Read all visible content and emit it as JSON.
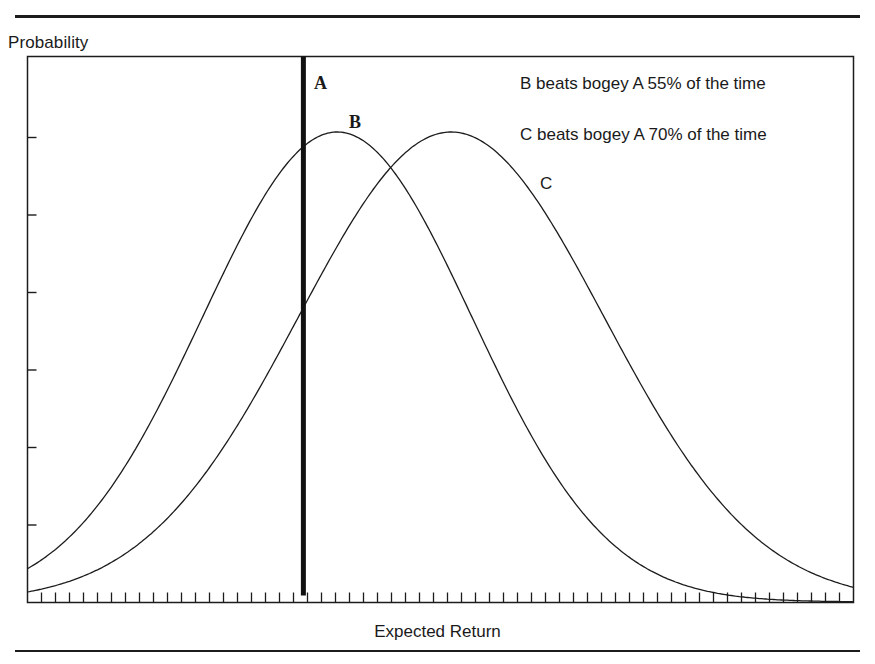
{
  "header": {
    "rule_top": true
  },
  "chart_data": {
    "type": "line",
    "title": "",
    "xlabel": "Expected Return",
    "ylabel": "Probability",
    "grid": false,
    "x_tick_count": 58,
    "y_tick_count": 6,
    "x_tick_labels": [],
    "y_tick_labels": [],
    "xlim": [
      0,
      100
    ],
    "ylim": [
      0,
      1
    ],
    "series": [
      {
        "name": "A",
        "kind": "vertical-line",
        "x": 33.4,
        "label": "A",
        "stroke_width": 5
      },
      {
        "name": "B",
        "kind": "normal-curve",
        "mean": 37.5,
        "sd": 16.3,
        "peak": 1.0,
        "label": "B"
      },
      {
        "name": "C",
        "kind": "normal-curve",
        "mean": 51.3,
        "sd": 18.5,
        "peak": 1.0,
        "label": "C"
      }
    ],
    "annotations": [
      "B beats bogey A 55% of the time",
      "C beats bogey A 70% of the time"
    ]
  },
  "labels": {
    "ylabel": "Probability",
    "xlabel": "Expected Return",
    "a": "A",
    "b": "B",
    "c": "C",
    "note_b": "B beats bogey A 55% of the time",
    "note_c": "C beats bogey A 70% of the time"
  },
  "colors": {
    "ink": "#1c1c1c",
    "background": "#ffffff"
  }
}
